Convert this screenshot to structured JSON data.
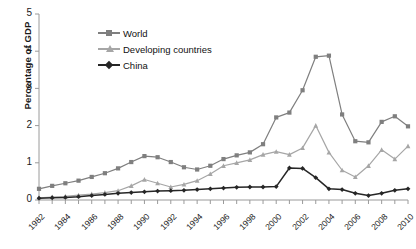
{
  "chart_data": {
    "type": "line",
    "title": "",
    "xlabel": "",
    "ylabel": "Percentage of GDP",
    "ylim": [
      0,
      5
    ],
    "yticks": [
      0,
      1,
      2,
      3,
      4,
      5
    ],
    "xlim": [
      1982,
      2010
    ],
    "x": [
      1982,
      1983,
      1984,
      1985,
      1986,
      1987,
      1988,
      1989,
      1990,
      1991,
      1992,
      1993,
      1994,
      1995,
      1996,
      1997,
      1998,
      1999,
      2000,
      2001,
      2002,
      2003,
      2004,
      2005,
      2006,
      2007,
      2008,
      2009,
      2010
    ],
    "xtick_labels": [
      "1982",
      "1984",
      "1986",
      "1988",
      "1990",
      "1992",
      "1994",
      "1996",
      "1998",
      "2000",
      "2002",
      "2004",
      "2006",
      "2008",
      "2010"
    ],
    "xtick_years": [
      1982,
      1984,
      1986,
      1988,
      1990,
      1992,
      1994,
      1996,
      1998,
      2000,
      2002,
      2004,
      2006,
      2008,
      2010
    ],
    "grid": false,
    "legend_position": "top-center",
    "series": [
      {
        "name": "World",
        "marker": "square",
        "color": "#7f7f7f",
        "values": [
          0.3,
          0.38,
          0.45,
          0.52,
          0.62,
          0.72,
          0.85,
          1.02,
          1.18,
          1.15,
          1.02,
          0.88,
          0.82,
          0.92,
          1.1,
          1.2,
          1.28,
          1.5,
          2.22,
          2.35,
          2.95,
          3.85,
          3.88,
          2.3,
          1.58,
          1.55,
          2.1,
          2.25,
          1.98
        ]
      },
      {
        "name": "Developing countries",
        "marker": "triangle",
        "color": "#a6a6a6",
        "values": [
          0.06,
          0.08,
          0.1,
          0.13,
          0.16,
          0.2,
          0.25,
          0.38,
          0.55,
          0.45,
          0.35,
          0.42,
          0.52,
          0.7,
          0.92,
          1.0,
          1.08,
          1.22,
          1.3,
          1.22,
          1.4,
          2.0,
          1.28,
          0.8,
          0.62,
          0.92,
          1.35,
          1.1,
          1.45
        ]
      },
      {
        "name": "China",
        "marker": "diamond",
        "color": "#262626",
        "values": [
          0.05,
          0.06,
          0.07,
          0.09,
          0.12,
          0.15,
          0.18,
          0.2,
          0.22,
          0.24,
          0.25,
          0.26,
          0.28,
          0.3,
          0.32,
          0.34,
          0.35,
          0.35,
          0.36,
          0.86,
          0.85,
          0.6,
          0.3,
          0.28,
          0.18,
          0.12,
          0.18,
          0.26,
          0.3
        ]
      }
    ],
    "series_overrides": {
      "note": "values are read from axis tick calibration"
    }
  }
}
